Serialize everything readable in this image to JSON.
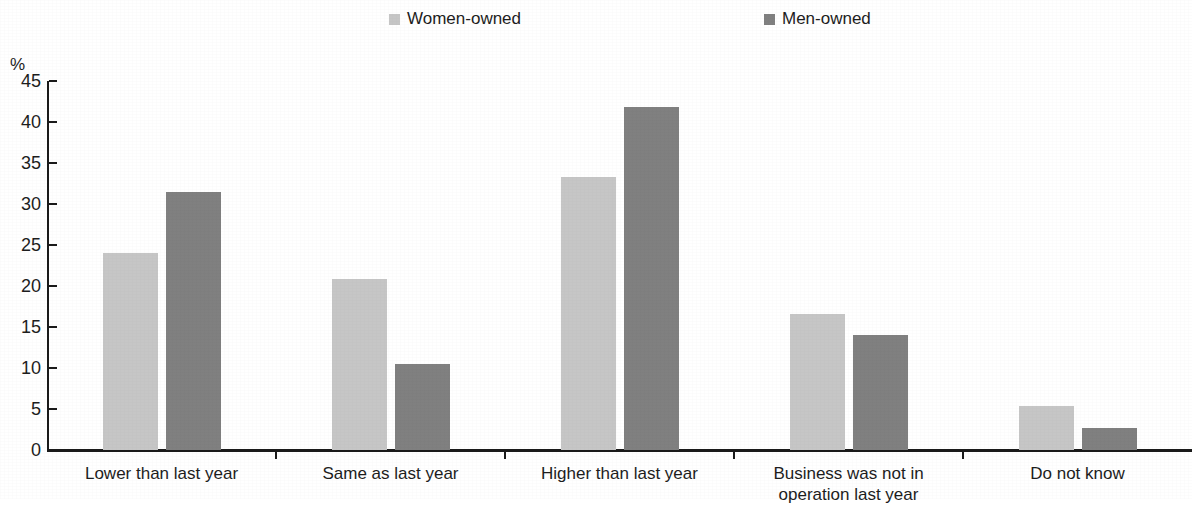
{
  "chart_data": {
    "type": "bar",
    "title": "",
    "subtitle": "",
    "xlabel": "",
    "ylabel": "%",
    "ylim": [
      0,
      45
    ],
    "ytick_step": 5,
    "yticks": [
      0,
      5,
      10,
      15,
      20,
      25,
      30,
      35,
      40,
      45
    ],
    "ytick_labels": [
      "0",
      "5",
      "10",
      "15",
      "20",
      "25",
      "30",
      "35",
      "40",
      "45"
    ],
    "grid": false,
    "legend_position": "top-center",
    "categories": [
      "Lower than last year",
      "Same as last year",
      "Higher than last year",
      "Business was not in operation last year",
      "Do not know"
    ],
    "category_lines": [
      [
        "Lower than last year"
      ],
      [
        "Same as last year"
      ],
      [
        "Higher than last year"
      ],
      [
        "Business was not in",
        "operation last year"
      ],
      [
        "Do not know"
      ]
    ],
    "series": [
      {
        "name": "Women-owned",
        "color": "#c6c6c6",
        "values": [
          24.0,
          20.9,
          33.3,
          16.6,
          5.4
        ]
      },
      {
        "name": "Men-owned",
        "color": "#808080",
        "values": [
          31.5,
          10.5,
          41.8,
          14.0,
          2.7
        ]
      }
    ],
    "annotations": []
  },
  "colors": {
    "axis": "#1a1a1a",
    "text": "#1d1d1d",
    "background": "#ffffff",
    "women_owned": "#c6c6c6",
    "men_owned": "#808080"
  }
}
